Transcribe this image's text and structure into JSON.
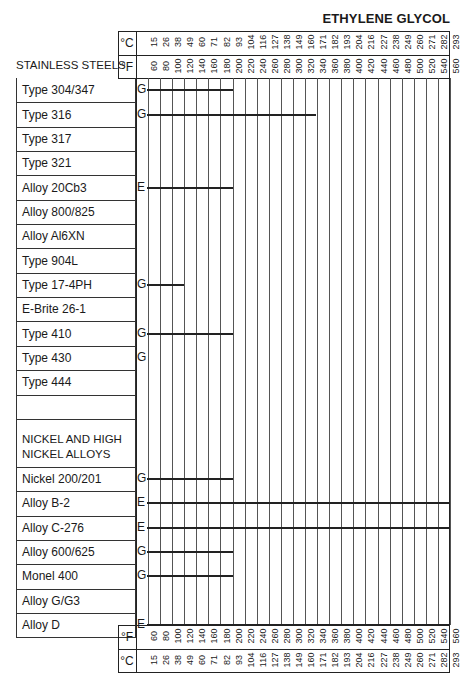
{
  "title": "ETHYLENE GLYCOL",
  "section_header": "STAINLESS STEELS",
  "units": {
    "celsius": "°C",
    "fahrenheit": "°F"
  },
  "chart_data": {
    "type": "table",
    "title": "ETHYLENE GLYCOL",
    "xlabel": "Temperature",
    "fahrenheit_ticks": [
      60,
      80,
      100,
      120,
      140,
      160,
      180,
      200,
      220,
      240,
      260,
      280,
      300,
      320,
      340,
      360,
      380,
      400,
      420,
      440,
      460,
      480,
      500,
      520,
      540,
      560
    ],
    "celsius_ticks": [
      15,
      26,
      38,
      49,
      60,
      71,
      82,
      93,
      104,
      116,
      127,
      138,
      149,
      160,
      171,
      182,
      193,
      204,
      216,
      227,
      238,
      249,
      260,
      271,
      282,
      293
    ],
    "legend": {
      "E": "Excellent",
      "G": "Good"
    },
    "rows": [
      {
        "material": "Type 304/347",
        "rating": "G",
        "max_F": 200
      },
      {
        "material": "Type 316",
        "rating": "G",
        "max_F": 340
      },
      {
        "material": "Type 317",
        "rating": "",
        "max_F": null
      },
      {
        "material": "Type 321",
        "rating": "",
        "max_F": null
      },
      {
        "material": "Alloy 20Cb3",
        "rating": "E",
        "max_F": 200
      },
      {
        "material": "Alloy 800/825",
        "rating": "",
        "max_F": null
      },
      {
        "material": "Alloy Al6XN",
        "rating": "",
        "max_F": null
      },
      {
        "material": "Type 904L",
        "rating": "",
        "max_F": null
      },
      {
        "material": "Type 17-4PH",
        "rating": "G",
        "max_F": 120
      },
      {
        "material": "E-Brite 26-1",
        "rating": "",
        "max_F": null
      },
      {
        "material": "Type 410",
        "rating": "G",
        "max_F": 200
      },
      {
        "material": "Type 430",
        "rating": "G",
        "max_F": 60
      },
      {
        "material": "Type 444",
        "rating": "",
        "max_F": null
      },
      {
        "material": "",
        "rating": "",
        "max_F": null
      },
      {
        "material": "NICKEL AND HIGH NICKEL ALLOYS",
        "rating": "",
        "max_F": null,
        "section": true
      },
      {
        "material": "Nickel 200/201",
        "rating": "G",
        "max_F": 200
      },
      {
        "material": "Alloy B-2",
        "rating": "E",
        "max_F": 560
      },
      {
        "material": "Alloy C-276",
        "rating": "E",
        "max_F": 560
      },
      {
        "material": "Alloy 600/625",
        "rating": "G",
        "max_F": 200
      },
      {
        "material": "Monel 400",
        "rating": "G",
        "max_F": 200
      },
      {
        "material": "Alloy G/G3",
        "rating": "",
        "max_F": null
      },
      {
        "material": "Alloy D",
        "rating": "E",
        "max_F": 560
      }
    ]
  }
}
